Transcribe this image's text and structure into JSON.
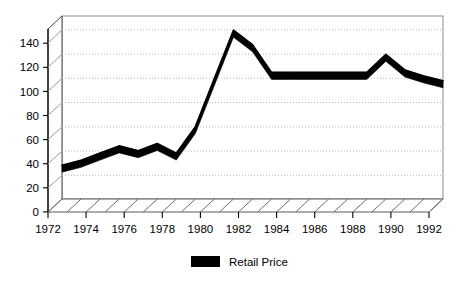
{
  "chart_data": {
    "type": "line",
    "title": "",
    "subtitle": "",
    "xlabel": "",
    "ylabel": "",
    "xlim": [
      1972,
      1992
    ],
    "ylim": [
      0,
      150
    ],
    "grid": true,
    "grid_style": "dotted-horizontal",
    "legend_position": "bottom-center",
    "style": "3d-ribbon-line",
    "series": [
      {
        "name": "Retail Price",
        "color": "#000000",
        "x": [
          1972,
          1973,
          1974,
          1975,
          1976,
          1977,
          1978,
          1979,
          1980,
          1981,
          1982,
          1983,
          1984,
          1985,
          1986,
          1987,
          1988,
          1989,
          1990,
          1991,
          1992
        ],
        "values": [
          28,
          32,
          38,
          44,
          40,
          46,
          38,
          60,
          100,
          140,
          128,
          105,
          105,
          105,
          105,
          105,
          105,
          120,
          107,
          102,
          98
        ]
      }
    ],
    "yticks": [
      0,
      20,
      40,
      60,
      80,
      100,
      120,
      140
    ],
    "ytick_labels": [
      "0",
      "20",
      "40",
      "60",
      "80",
      "100",
      "120",
      "140"
    ],
    "xticks": [
      1972,
      1974,
      1976,
      1978,
      1980,
      1982,
      1984,
      1986,
      1988,
      1990,
      1992
    ],
    "xtick_labels": [
      "1972",
      "1974",
      "1976",
      "1978",
      "1980",
      "1982",
      "1984",
      "1986",
      "1988",
      "1990",
      "1992"
    ],
    "legend": [
      {
        "label": "Retail Price",
        "color": "#000000",
        "marker": "filled-rectangle"
      }
    ],
    "colors": {
      "series": "#000000",
      "axis": "#000000",
      "grid": "#b9b9b9",
      "floor": "#8a8a8a",
      "background": "#ffffff"
    }
  }
}
